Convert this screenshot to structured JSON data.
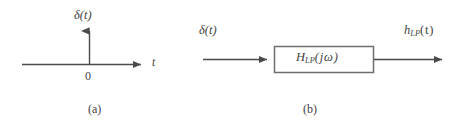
{
  "figure": {
    "caption_a": "(a)",
    "caption_b": "(b)",
    "line_color": "#4a4a4a",
    "box_border_color": "#6e6e6e",
    "background": "#ffffff",
    "text_color": "#3f3f3f"
  },
  "panel_a": {
    "name": "impulse-function-axes",
    "vertical_axis_label": "δ(t)",
    "horizontal_axis_label": "t",
    "origin_label": "0",
    "caption": "(a)",
    "axes": {
      "x_axis_start_x": 22,
      "x_axis_end_x": 148,
      "x_axis_y": 64,
      "y_axis_x": 89,
      "y_axis_top_y": 24,
      "y_axis_bottom_y": 65
    }
  },
  "panel_b": {
    "name": "lowpass-filter-block-diagram",
    "input_label": "δ(t)",
    "output_label": "h",
    "output_label_sub": "LP",
    "output_label_tail": "(t)",
    "block_label_main": "H",
    "block_label_sub": "LP",
    "block_label_arg": "(jω)",
    "caption": "(b)",
    "block": {
      "left_x": 274,
      "top_y": 46,
      "right_x": 374,
      "bottom_y": 73
    },
    "input_arrow": {
      "start_x": 203,
      "end_x": 274,
      "y": 59
    },
    "output_arrow": {
      "start_x": 374,
      "end_x": 449,
      "y": 59
    }
  }
}
